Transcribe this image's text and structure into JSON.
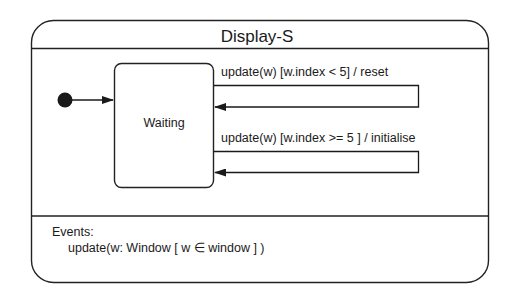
{
  "diagram": {
    "type": "state-machine",
    "title": "Display-S",
    "states": [
      {
        "id": "waiting",
        "label": "Waiting"
      }
    ],
    "initial_state": "waiting",
    "transitions": [
      {
        "from": "waiting",
        "to": "waiting",
        "label": "update(w) [w.index < 5] / reset"
      },
      {
        "from": "waiting",
        "to": "waiting",
        "label": "update(w) [w.index >= 5 ] / initialise"
      }
    ],
    "events": {
      "heading": "Events:",
      "items": [
        "update(w: Window [ w ∈ window ] )"
      ]
    }
  }
}
